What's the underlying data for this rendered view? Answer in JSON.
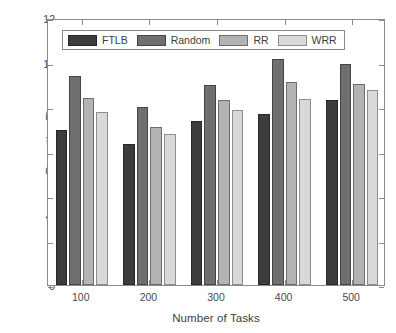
{
  "chart_data": {
    "type": "bar",
    "title": "",
    "xlabel": "Number of Tasks",
    "ylabel": "Average Execution Time",
    "categories": [
      "100",
      "200",
      "300",
      "400",
      "500"
    ],
    "series": [
      {
        "name": "FTLB",
        "values": [
          6.95,
          6.32,
          7.38,
          7.68,
          8.33
        ],
        "color": "#3c3c3c"
      },
      {
        "name": "Random",
        "values": [
          9.38,
          8.0,
          9.0,
          10.18,
          9.95
        ],
        "color": "#6f6f6f"
      },
      {
        "name": "RR",
        "values": [
          8.4,
          7.1,
          8.3,
          9.13,
          9.05
        ],
        "color": "#b3b3b3"
      },
      {
        "name": "WRR",
        "values": [
          7.78,
          6.8,
          7.87,
          8.35,
          8.77
        ],
        "color": "#d9d9d9"
      }
    ],
    "ylim": [
      0,
      12
    ],
    "yticks": [
      0,
      2,
      4,
      6,
      8,
      10,
      12
    ],
    "ytick_labels": [
      "0",
      "2",
      "4",
      "6",
      "8",
      "10",
      "12"
    ],
    "xtick_labels": [
      "100",
      "200",
      "300",
      "400",
      "500"
    ],
    "grid": false,
    "legend_position": "top-left",
    "legend_entries": [
      "FTLB",
      "Random",
      "RR",
      "WRR"
    ],
    "axis_color": "#8a8a8a",
    "background": "#ffffff"
  }
}
